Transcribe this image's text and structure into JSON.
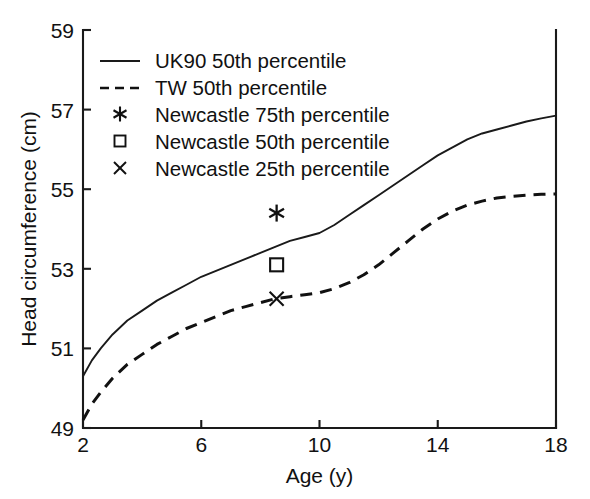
{
  "chart_data": {
    "type": "line",
    "title": "",
    "xlabel": "Age (y)",
    "ylabel": "Head circumference (cm)",
    "xlim": [
      2,
      18
    ],
    "ylim": [
      49,
      59
    ],
    "xticks": [
      2,
      6,
      10,
      14,
      18
    ],
    "xtick_labels": [
      "2",
      "6",
      "10",
      "14",
      "18"
    ],
    "yticks": [
      49,
      51,
      53,
      55,
      57,
      59
    ],
    "ytick_labels": [
      "49",
      "51",
      "53",
      "55",
      "57",
      "59"
    ],
    "grid": false,
    "legend_position": "top-left-inside",
    "series": [
      {
        "name": "UK90 50th percentile",
        "marker": "line-solid",
        "style": "solid",
        "x": [
          2.0,
          2.3,
          2.6,
          3.0,
          3.5,
          4.0,
          4.5,
          5.0,
          5.5,
          6.0,
          6.5,
          7.0,
          7.5,
          8.0,
          8.5,
          9.0,
          9.5,
          10.0,
          10.5,
          11.0,
          11.5,
          12.0,
          12.5,
          13.0,
          13.5,
          14.0,
          14.5,
          15.0,
          15.5,
          16.0,
          16.5,
          17.0,
          17.5,
          18.0
        ],
        "values": [
          50.3,
          50.7,
          51.0,
          51.35,
          51.7,
          51.95,
          52.2,
          52.4,
          52.6,
          52.8,
          52.95,
          53.1,
          53.25,
          53.4,
          53.55,
          53.7,
          53.8,
          53.9,
          54.1,
          54.35,
          54.6,
          54.85,
          55.1,
          55.35,
          55.6,
          55.85,
          56.05,
          56.25,
          56.4,
          56.5,
          56.6,
          56.7,
          56.78,
          56.85
        ]
      },
      {
        "name": "TW 50th percentile",
        "marker": "line-dashed",
        "style": "dashed",
        "x": [
          2.0,
          2.3,
          2.6,
          3.0,
          3.5,
          4.0,
          4.5,
          5.0,
          5.5,
          6.0,
          6.5,
          7.0,
          7.5,
          8.0,
          8.5,
          9.0,
          9.5,
          10.0,
          10.5,
          11.0,
          11.5,
          12.0,
          12.5,
          13.0,
          13.5,
          14.0,
          14.5,
          15.0,
          15.5,
          16.0,
          16.5,
          17.0,
          17.5,
          18.0
        ],
        "values": [
          49.2,
          49.6,
          49.9,
          50.25,
          50.6,
          50.85,
          51.1,
          51.3,
          51.5,
          51.65,
          51.8,
          51.95,
          52.05,
          52.15,
          52.25,
          52.3,
          52.35,
          52.4,
          52.5,
          52.65,
          52.85,
          53.1,
          53.4,
          53.7,
          54.0,
          54.25,
          54.45,
          54.6,
          54.7,
          54.78,
          54.82,
          54.85,
          54.87,
          54.88
        ]
      },
      {
        "name": "Newcastle 75th percentile",
        "marker": "asterisk",
        "style": "point",
        "x": [
          8.55
        ],
        "values": [
          54.4
        ]
      },
      {
        "name": "Newcastle 50th percentile",
        "marker": "square",
        "style": "point",
        "x": [
          8.55
        ],
        "values": [
          53.1
        ]
      },
      {
        "name": "Newcastle 25th percentile",
        "marker": "cross",
        "style": "point",
        "x": [
          8.55
        ],
        "values": [
          52.25
        ]
      }
    ],
    "legend": [
      "UK90 50th percentile",
      "TW 50th percentile",
      "Newcastle 75th percentile",
      "Newcastle 50th percentile",
      "Newcastle 25th percentile"
    ],
    "colors": {
      "line": "#1a1a1a",
      "background": "#ffffff"
    }
  }
}
